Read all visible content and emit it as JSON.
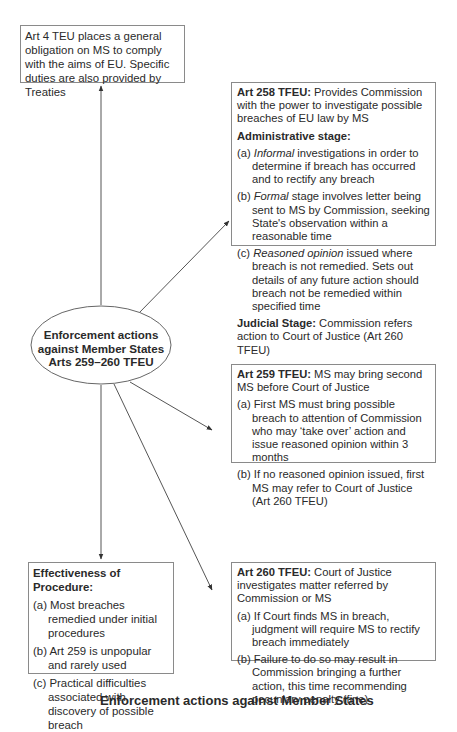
{
  "center_node": {
    "line1": "Enforcement actions",
    "line2": "against Member States",
    "line3": "Arts 259–260 TFEU"
  },
  "art4_box": {
    "text": "Art 4 TEU places a general obligation on MS to comply with the aims of EU. Specific duties are also provided by Treaties"
  },
  "art258_box": {
    "title": "Art 258 TFEU:",
    "title_rest": " Provides Commission with the power to investigate possible breaches of EU law by MS",
    "admin_heading": "Administrative stage:",
    "items": [
      {
        "label": "(a) ",
        "em": "Informal",
        "rest": " investigations in order to determine if breach has occurred and to rectify any breach"
      },
      {
        "label": "(b) ",
        "em": "Formal",
        "rest": " stage involves letter being sent to MS by Commission, seeking State's observation within a reasonable time"
      },
      {
        "label": "(c) ",
        "em": "Reasoned opinion",
        "rest": " issued where breach is not remedied. Sets out details of any future action should breach not be remedied within specified time"
      }
    ],
    "judicial_heading": "Judicial Stage:",
    "judicial_rest": " Commission refers action to Court of Justice (Art 260 TFEU)"
  },
  "art259_box": {
    "title": "Art 259 TFEU:",
    "title_rest": " MS may bring second MS before Court of Justice",
    "items": [
      {
        "label": "(a) ",
        "text": "First MS must bring possible breach to attention of Commission who may ‘take over’ action and issue reasoned opinion within 3 months"
      },
      {
        "label": "(b) ",
        "text": "If no reasoned opinion issued, first MS may refer to Court of Justice (Art 260 TFEU)"
      }
    ]
  },
  "effectiveness_box": {
    "title": "Effectiveness of Procedure:",
    "items": [
      {
        "label": "(a) ",
        "text": "Most breaches remedied under initial procedures"
      },
      {
        "label": "(b) ",
        "text": "Art 259 is unpopular and rarely used"
      },
      {
        "label": "(c) ",
        "text": "Practical difficulties associated with discovery of possible breach"
      }
    ]
  },
  "art260_box": {
    "title": "Art 260 TFEU:",
    "title_rest": " Court of Justice investigates matter referred by Commission or MS",
    "items": [
      {
        "label": "(a) ",
        "text": "If Court finds MS in breach, judgment will require MS to rectify breach immediately"
      },
      {
        "label": "(b) ",
        "text": "Failure to do so may result in Commission bringing a further action, this time recommending pecuniary penalty (fine)"
      }
    ]
  },
  "caption": "Enforcement actions against Member States",
  "colors": {
    "line": "#555555",
    "border": "#8a8a8a",
    "text": "#2a2a2a"
  }
}
